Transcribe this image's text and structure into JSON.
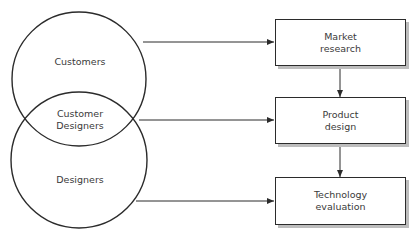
{
  "diagram": {
    "type": "venn-to-flow",
    "circles": [
      {
        "id": "customers",
        "label": "Customers"
      },
      {
        "id": "designers",
        "label": "Designers"
      }
    ],
    "overlap": {
      "line1": "Customer",
      "line2": "Designers"
    },
    "boxes": [
      {
        "id": "market-research",
        "line1": "Market",
        "line2": "research"
      },
      {
        "id": "product-design",
        "line1": "Product",
        "line2": "design"
      },
      {
        "id": "technology-evaluation",
        "line1": "Technology",
        "line2": "evaluation"
      }
    ],
    "edges": [
      {
        "from": "Customers",
        "to": "Market research"
      },
      {
        "from": "Customer Designers",
        "to": "Product design"
      },
      {
        "from": "Designers",
        "to": "Technology evaluation"
      },
      {
        "from": "Market research",
        "to": "Product design"
      },
      {
        "from": "Product design",
        "to": "Technology evaluation"
      }
    ],
    "colors": {
      "stroke": "#2b2b2b",
      "text": "#3a3a3a",
      "shadow": "#bdbdbd"
    }
  }
}
